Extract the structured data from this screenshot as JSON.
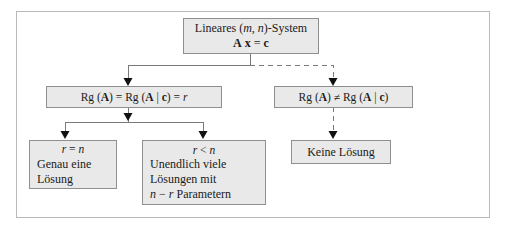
{
  "diagram": {
    "frame_color": "#b9b9b9",
    "node_fill": "#e9e9e9",
    "node_border": "#8f8f8f",
    "line_color": "#7a7a7a"
  },
  "nodes": {
    "root": {
      "line1_pre": "Lineares (",
      "line1_m": "m",
      "line1_comma": ", ",
      "line1_n": "n",
      "line1_post": ")-System",
      "line2_A": "A",
      "line2_x": "x",
      "line2_eq": " = ",
      "line2_c": "c"
    },
    "rank_equal": {
      "rg1": "Rg (",
      "A1": "A",
      "rg1_close": ")",
      "eq1": " = ",
      "rg2": "Rg (",
      "A2": "A",
      "bar": " | ",
      "c": "c",
      "rg2_close": ")",
      "eq2": " = ",
      "r": "r"
    },
    "rank_unequal": {
      "rg1": "Rg (",
      "A1": "A",
      "rg1_close": ")",
      "neq": " ≠ ",
      "rg2": "Rg (",
      "A2": "A",
      "bar": " | ",
      "c": "c",
      "rg2_close": ")"
    },
    "unique": {
      "cond_r": "r",
      "cond_op": " = ",
      "cond_n": "n",
      "line1": "Genau eine",
      "line2": "Lösung"
    },
    "infinite": {
      "cond_r": "r",
      "cond_op": " < ",
      "cond_n": "n",
      "line1": "Unendlich viele",
      "line2": "Lösungen mit",
      "line3_n": "n",
      "line3_minus": " − ",
      "line3_r": "r",
      "line3_word": " Parametern"
    },
    "no_solution": {
      "label": "Keine Lösung"
    }
  },
  "edges": [
    {
      "name": "root-to-rank-equal",
      "style": "solid"
    },
    {
      "name": "root-to-rank-unequal",
      "style": "dashed"
    },
    {
      "name": "rank-equal-to-unique",
      "style": "solid"
    },
    {
      "name": "rank-equal-to-infinite",
      "style": "solid"
    },
    {
      "name": "rank-unequal-to-no-solution",
      "style": "dashed"
    }
  ]
}
